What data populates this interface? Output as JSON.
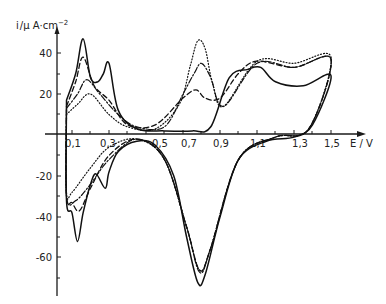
{
  "chart_data": {
    "type": "line",
    "title": "",
    "xlabel": "E / V",
    "ylabel": "i / µA·cm⁻²",
    "xlim": [
      0.0,
      1.6
    ],
    "ylim": [
      -75,
      50
    ],
    "x_ticks": [
      "0,1",
      "0,3",
      "0,5",
      "0,7",
      "0,9",
      "1,1",
      "1,3",
      "1,5"
    ],
    "y_ticks": [
      "40",
      "20",
      "-20",
      "-40",
      "-60"
    ],
    "grid": false,
    "legend": null,
    "series": [
      {
        "name": "solid",
        "style": "solid",
        "anodic": {
          "x": [
            0.07,
            0.12,
            0.16,
            0.2,
            0.24,
            0.27,
            0.3,
            0.35,
            0.45,
            0.6,
            0.75,
            0.85,
            0.95,
            1.05,
            1.12,
            1.2,
            1.35,
            1.5
          ],
          "y": [
            17,
            30,
            47,
            28,
            26,
            30,
            35,
            12,
            3,
            2,
            2,
            4,
            28,
            32,
            33,
            26,
            24,
            29
          ]
        },
        "cathodic": {
          "x": [
            1.5,
            1.4,
            1.3,
            1.15,
            1.0,
            0.9,
            0.82,
            0.78,
            0.72,
            0.65,
            0.55,
            0.45,
            0.35,
            0.3,
            0.28,
            0.23,
            0.2,
            0.16,
            0.13,
            0.1,
            0.07
          ],
          "y": [
            28,
            5,
            -1,
            -3,
            -12,
            -40,
            -68,
            -72,
            -50,
            -20,
            -5,
            -3,
            -8,
            -18,
            -26,
            -19,
            -24,
            -38,
            -52,
            -38,
            -32
          ]
        }
      },
      {
        "name": "dashed",
        "style": "dashed",
        "anodic": {
          "x": [
            0.07,
            0.12,
            0.16,
            0.22,
            0.3,
            0.4,
            0.55,
            0.7,
            0.77,
            0.82,
            0.9,
            1.0,
            1.1,
            1.3,
            1.5
          ],
          "y": [
            14,
            26,
            38,
            24,
            17,
            5,
            5,
            18,
            22,
            18,
            18,
            30,
            36,
            33,
            37
          ]
        },
        "cathodic": {
          "x": [
            1.5,
            1.38,
            1.2,
            1.0,
            0.85,
            0.79,
            0.72,
            0.6,
            0.45,
            0.3,
            0.2,
            0.14,
            0.1,
            0.07
          ],
          "y": [
            37,
            3,
            -1,
            -12,
            -55,
            -66,
            -45,
            -12,
            -2,
            -10,
            -26,
            -37,
            -33,
            -30
          ]
        }
      },
      {
        "name": "dash-dot",
        "style": "dash-dot",
        "anodic": {
          "x": [
            0.07,
            0.13,
            0.18,
            0.25,
            0.35,
            0.45,
            0.6,
            0.7,
            0.76,
            0.8,
            0.85,
            0.92,
            1.1,
            1.3,
            1.5
          ],
          "y": [
            13,
            20,
            27,
            20,
            10,
            4,
            4,
            20,
            30,
            35,
            28,
            14,
            35,
            33,
            37
          ]
        },
        "cathodic": {
          "x": [
            1.5,
            1.38,
            1.2,
            1.0,
            0.85,
            0.79,
            0.72,
            0.6,
            0.45,
            0.3,
            0.2,
            0.12,
            0.07
          ],
          "y": [
            37,
            3,
            -1,
            -12,
            -55,
            -67,
            -45,
            -12,
            -2,
            -12,
            -24,
            -32,
            -30
          ]
        }
      },
      {
        "name": "dotted",
        "style": "dotted",
        "anodic": {
          "x": [
            0.07,
            0.13,
            0.2,
            0.3,
            0.4,
            0.55,
            0.68,
            0.74,
            0.78,
            0.82,
            0.86,
            0.92,
            1.1,
            1.3,
            1.5
          ],
          "y": [
            10,
            15,
            20,
            10,
            4,
            3,
            15,
            34,
            46,
            42,
            25,
            14,
            36,
            35,
            38
          ]
        },
        "cathodic": {
          "x": [
            1.5,
            1.38,
            1.2,
            1.0,
            0.85,
            0.79,
            0.72,
            0.6,
            0.45,
            0.3,
            0.2,
            0.1,
            0.07
          ],
          "y": [
            38,
            3,
            -1,
            -12,
            -55,
            -66,
            -45,
            -12,
            -2,
            -6,
            -16,
            -28,
            -28
          ]
        }
      }
    ]
  },
  "axes": {
    "y_label_i": "i",
    "y_label_unit": "/µ A·cm",
    "y_label_exp": "−2",
    "x_label": "E / V"
  }
}
